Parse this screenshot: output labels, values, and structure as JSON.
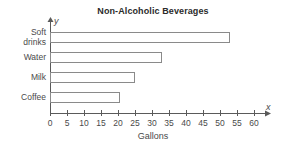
{
  "chart_data": {
    "type": "bar",
    "orientation": "horizontal",
    "title": "Non-Alcoholic Beverages",
    "xlabel": "Gallons",
    "ylabel": "",
    "x_axis_name": "x",
    "y_axis_name": "y",
    "categories": [
      "Soft drinks",
      "Water",
      "Milk",
      "Coffee"
    ],
    "category_lines": [
      [
        "Soft",
        "drinks"
      ],
      [
        "Water"
      ],
      [
        "Milk"
      ],
      [
        "Coffee"
      ]
    ],
    "values": [
      53,
      33,
      25,
      20.5
    ],
    "xlim": [
      0,
      60
    ],
    "xticks": [
      0,
      5,
      10,
      15,
      20,
      25,
      30,
      35,
      40,
      45,
      50,
      55,
      60
    ],
    "xtick_labels": [
      "0",
      "5",
      "10",
      "15",
      "20",
      "25",
      "30",
      "35",
      "40",
      "45",
      "50",
      "55",
      "60"
    ],
    "grid": false,
    "legend": "none",
    "bar_fill_color": "#ffffff",
    "bar_edge_color": "#8a8a8a",
    "axis_color": "#5a5a5a",
    "text_color": "#4a4a4a",
    "title_color": "#2b2b2b"
  }
}
